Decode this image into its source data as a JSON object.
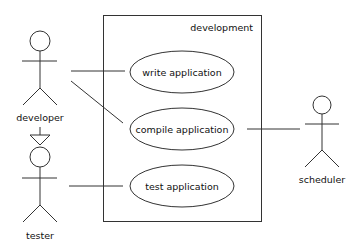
{
  "diagram": {
    "type": "uml-use-case",
    "system": {
      "label": "development"
    },
    "use_cases": [
      {
        "label": "write application"
      },
      {
        "label": "compile application"
      },
      {
        "label": "test application"
      }
    ],
    "actors": [
      {
        "label": "developer"
      },
      {
        "label": "tester"
      },
      {
        "label": "scheduler"
      }
    ],
    "relations": [
      {
        "from": "developer",
        "to": "write application",
        "kind": "association"
      },
      {
        "from": "developer",
        "to": "compile application",
        "kind": "association"
      },
      {
        "from": "tester",
        "to": "test application",
        "kind": "association"
      },
      {
        "from": "scheduler",
        "to": "compile application",
        "kind": "association"
      },
      {
        "from": "tester",
        "to": "developer",
        "kind": "generalization"
      }
    ],
    "colors": {
      "line": "#333333",
      "background": "#ffffff",
      "text": "#111111"
    }
  }
}
